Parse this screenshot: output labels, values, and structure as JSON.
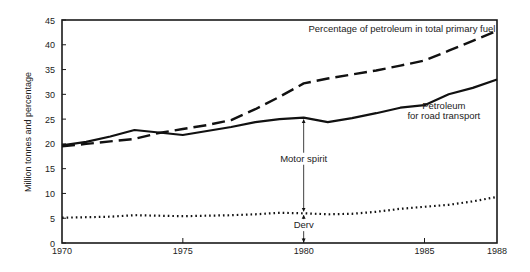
{
  "chart_data": {
    "type": "line",
    "title": "",
    "xlabel": "",
    "ylabel": "Million tonnes and percentage",
    "xlim": [
      1970,
      1988
    ],
    "ylim": [
      0,
      45
    ],
    "x_ticks": [
      1970,
      1975,
      1980,
      1985,
      1988
    ],
    "y_ticks": [
      0,
      5,
      10,
      15,
      20,
      25,
      30,
      35,
      40,
      45
    ],
    "grid": false,
    "legend": "none (inline labels)",
    "series": [
      {
        "name": "Percentage of petroleum in total primary fuel",
        "style": "dashed",
        "x": [
          1970,
          1971,
          1972,
          1973,
          1974,
          1975,
          1976,
          1977,
          1978,
          1979,
          1980,
          1981,
          1982,
          1983,
          1984,
          1985,
          1986,
          1987,
          1988
        ],
        "values": [
          19.5,
          20.0,
          20.5,
          21.0,
          22.2,
          23.0,
          23.8,
          24.8,
          27.0,
          29.5,
          32.2,
          33.2,
          34.0,
          34.8,
          35.8,
          36.8,
          38.8,
          40.8,
          42.8
        ]
      },
      {
        "name": "Petroleum for road transport",
        "style": "solid",
        "x": [
          1970,
          1971,
          1972,
          1973,
          1974,
          1975,
          1976,
          1977,
          1978,
          1979,
          1980,
          1981,
          1982,
          1983,
          1984,
          1985,
          1986,
          1987,
          1988
        ],
        "values": [
          19.7,
          20.4,
          21.5,
          22.8,
          22.3,
          21.8,
          22.6,
          23.4,
          24.4,
          25.0,
          25.3,
          24.4,
          25.2,
          26.2,
          27.3,
          27.8,
          30.0,
          31.3,
          33.0
        ]
      },
      {
        "name": "Derv",
        "style": "dotted",
        "x": [
          1970,
          1971,
          1972,
          1973,
          1974,
          1975,
          1976,
          1977,
          1978,
          1979,
          1980,
          1981,
          1982,
          1983,
          1984,
          1985,
          1986,
          1987,
          1988
        ],
        "values": [
          5.1,
          5.2,
          5.3,
          5.6,
          5.5,
          5.4,
          5.5,
          5.6,
          5.8,
          6.1,
          6.0,
          5.8,
          5.9,
          6.3,
          6.9,
          7.3,
          7.7,
          8.4,
          9.3
        ]
      }
    ],
    "annotations": [
      {
        "text": "Percentage of petroleum in total primary fuel",
        "x": 1980.2,
        "y": 42.5
      },
      {
        "text": "Petroleum",
        "x": 1985.8,
        "y": 27.0
      },
      {
        "text": "for road transport",
        "x": 1985.8,
        "y": 25.0
      },
      {
        "text": "Motor spirit",
        "x": 1980,
        "y": 16.4,
        "note": "double-headed arrow from Derv line to road transport line at 1980"
      },
      {
        "text": "Derv",
        "x": 1980,
        "y": 3.0,
        "note": "double-headed arrow from 0 to Derv line at 1980"
      }
    ]
  }
}
